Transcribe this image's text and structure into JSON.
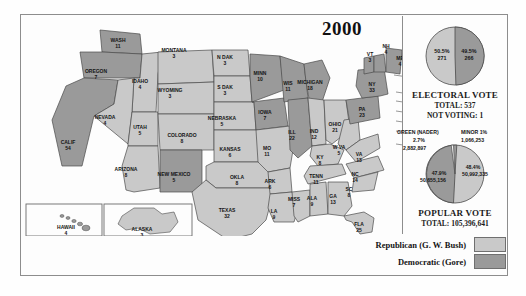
{
  "title": "2000",
  "map": {
    "name": "us-electoral-map-2000",
    "colors": {
      "republican": "#c9c9c9",
      "democratic": "#9a9a9a",
      "stroke": "#4a4a4a",
      "water": "#ffffff"
    },
    "states": [
      {
        "code": "WASH",
        "label": "WASH",
        "votes": "11",
        "party": "dem",
        "x": 96,
        "y": 26
      },
      {
        "code": "OREGON",
        "label": "OREGON",
        "votes": "7",
        "party": "dem",
        "x": 74,
        "y": 57
      },
      {
        "code": "CALIF",
        "label": "CALIF",
        "votes": "54",
        "party": "dem",
        "x": 46,
        "y": 128
      },
      {
        "code": "IDAHO",
        "label": "IDAHO",
        "votes": "4",
        "party": "rep",
        "x": 118,
        "y": 67
      },
      {
        "code": "NEVADA",
        "label": "NEVADA",
        "votes": "4",
        "party": "rep",
        "x": 83,
        "y": 103
      },
      {
        "code": "UTAH",
        "label": "UTAH",
        "votes": "5",
        "party": "rep",
        "x": 118,
        "y": 113
      },
      {
        "code": "ARIZONA",
        "label": "ARIZONA",
        "votes": "8",
        "party": "rep",
        "x": 104,
        "y": 155
      },
      {
        "code": "MONTANA",
        "label": "MONTANA",
        "votes": "3",
        "party": "rep",
        "x": 152,
        "y": 36
      },
      {
        "code": "WYOMING",
        "label": "WYOMING",
        "votes": "3",
        "party": "rep",
        "x": 148,
        "y": 76
      },
      {
        "code": "COLORADO",
        "label": "COLORADO",
        "votes": "8",
        "party": "rep",
        "x": 160,
        "y": 121
      },
      {
        "code": "NEWMEX",
        "label": "NEW MEXICO",
        "votes": "5",
        "party": "dem",
        "x": 152,
        "y": 160
      },
      {
        "code": "NDAK",
        "label": "N DAK",
        "votes": "3",
        "party": "rep",
        "x": 203,
        "y": 43
      },
      {
        "code": "SDAK",
        "label": "S DAK",
        "votes": "3",
        "party": "rep",
        "x": 203,
        "y": 73
      },
      {
        "code": "NEBRASKA",
        "label": "NEBRASKA",
        "votes": "5",
        "party": "rep",
        "x": 200,
        "y": 104
      },
      {
        "code": "KANSAS",
        "label": "KANSAS",
        "votes": "6",
        "party": "rep",
        "x": 208,
        "y": 135
      },
      {
        "code": "OKLA",
        "label": "OKLA",
        "votes": "8",
        "party": "rep",
        "x": 215,
        "y": 163
      },
      {
        "code": "TEXAS",
        "label": "TEXAS",
        "votes": "32",
        "party": "rep",
        "x": 205,
        "y": 196
      },
      {
        "code": "MINN",
        "label": "MINN",
        "votes": "10",
        "party": "dem",
        "x": 238,
        "y": 59
      },
      {
        "code": "IOWA",
        "label": "IOWA",
        "votes": "7",
        "party": "dem",
        "x": 243,
        "y": 98
      },
      {
        "code": "MO",
        "label": "MO",
        "votes": "11",
        "party": "rep",
        "x": 245,
        "y": 134
      },
      {
        "code": "ARK",
        "label": "ARK",
        "votes": "6",
        "party": "rep",
        "x": 248,
        "y": 167
      },
      {
        "code": "LA",
        "label": "LA",
        "votes": "9",
        "party": "rep",
        "x": 252,
        "y": 197
      },
      {
        "code": "WIS",
        "label": "WIS",
        "votes": "11",
        "party": "dem",
        "x": 266,
        "y": 69
      },
      {
        "code": "ILL",
        "label": "ILL",
        "votes": "22",
        "party": "dem",
        "x": 270,
        "y": 118
      },
      {
        "code": "MISS",
        "label": "MISS",
        "votes": "7",
        "party": "rep",
        "x": 272,
        "y": 185
      },
      {
        "code": "MICHIGAN",
        "label": "MICHIGAN",
        "votes": "18",
        "party": "dem",
        "x": 288,
        "y": 68
      },
      {
        "code": "IND",
        "label": "IND",
        "votes": "12",
        "party": "rep",
        "x": 292,
        "y": 117
      },
      {
        "code": "KY",
        "label": "KY",
        "votes": "8",
        "party": "rep",
        "x": 298,
        "y": 143
      },
      {
        "code": "TENN",
        "label": "TENN",
        "votes": "11",
        "party": "rep",
        "x": 294,
        "y": 162
      },
      {
        "code": "ALA",
        "label": "ALA",
        "votes": "9",
        "party": "rep",
        "x": 290,
        "y": 184
      },
      {
        "code": "OHIO",
        "label": "OHIO",
        "votes": "21",
        "party": "rep",
        "x": 313,
        "y": 110
      },
      {
        "code": "WVA",
        "label": "W VA",
        "votes": "5",
        "party": "rep",
        "x": 317,
        "y": 133
      },
      {
        "code": "GA",
        "label": "GA",
        "votes": "13",
        "party": "rep",
        "x": 311,
        "y": 182
      },
      {
        "code": "FLA",
        "label": "FLA",
        "votes": "25",
        "party": "rep",
        "x": 337,
        "y": 210
      },
      {
        "code": "PA",
        "label": "PA",
        "votes": "23",
        "party": "dem",
        "x": 340,
        "y": 95
      },
      {
        "code": "VA",
        "label": "VA",
        "votes": "13",
        "party": "rep",
        "x": 337,
        "y": 140
      },
      {
        "code": "NC",
        "label": "NC",
        "votes": "14",
        "party": "rep",
        "x": 333,
        "y": 160
      },
      {
        "code": "SC",
        "label": "SC",
        "votes": "8",
        "party": "rep",
        "x": 327,
        "y": 175
      },
      {
        "code": "NY",
        "label": "NY",
        "votes": "33",
        "party": "dem",
        "x": 350,
        "y": 70
      },
      {
        "code": "VT",
        "label": "VT",
        "votes": "3",
        "party": "dem",
        "x": 348,
        "y": 40
      },
      {
        "code": "NH",
        "label": "NH",
        "votes": "4",
        "party": "dem",
        "x": 364,
        "y": 32
      },
      {
        "code": "ME",
        "label": "ME",
        "votes": "4",
        "party": "dem",
        "x": 378,
        "y": 44
      },
      {
        "code": "HAWAII",
        "label": "HAWAII",
        "votes": "4",
        "party": "dem",
        "x": 44,
        "y": 213
      },
      {
        "code": "ALASKA",
        "label": "ALASKA",
        "votes": "3",
        "party": "rep",
        "x": 120,
        "y": 215
      }
    ],
    "callouts": [
      {
        "code": "MASS",
        "text": "MASS",
        "votes": "12",
        "party": "dem",
        "x": 388,
        "y": 63
      },
      {
        "code": "RI",
        "text": "R.I. 4",
        "party": "dem",
        "x": 390,
        "y": 80
      },
      {
        "code": "CONN",
        "text": "CONN 8",
        "party": "dem",
        "x": 390,
        "y": 89
      },
      {
        "code": "NJ",
        "text": "NJ 15",
        "party": "dem",
        "x": 390,
        "y": 99
      },
      {
        "code": "DEL",
        "text": "DEL 3",
        "party": "dem",
        "x": 390,
        "y": 109
      },
      {
        "code": "MD",
        "text": "MD 10",
        "party": "dem",
        "x": 390,
        "y": 119
      },
      {
        "code": "DC",
        "text": "DC 3",
        "party": "dem",
        "x": 390,
        "y": 132
      }
    ]
  },
  "electoral": {
    "title": "ELECTORAL VOTE",
    "total_label": "TOTAL:  537",
    "notvoting_label": "NOT VOTING:  1",
    "left": {
      "pct": "50.5%",
      "votes": "271",
      "party": "rep"
    },
    "right": {
      "pct": "49.5%",
      "votes": "266",
      "party": "dem"
    }
  },
  "popular": {
    "title": "POPULAR VOTE",
    "total_label": "TOTAL:  105,396,641",
    "green_name": "GREEN (NADER)",
    "green_pct": "2.7%",
    "green_votes": "2,882,897",
    "minor_name": "MINOR  1%",
    "minor_votes": "1,066,253",
    "dem_pct": "47.9%",
    "dem_votes": "50,655,156",
    "rep_pct": "48.4%",
    "rep_votes": "50,992,335"
  },
  "legend": {
    "republican": "Republican (G. W. Bush)",
    "democratic": "Democratic (Gore)"
  },
  "chart_data": [
    {
      "type": "pie",
      "title": "ELECTORAL VOTE",
      "categories": [
        "Republican (G. W. Bush)",
        "Democratic (Gore)"
      ],
      "values": [
        271,
        266
      ],
      "percents": [
        50.5,
        49.5
      ],
      "total": 537,
      "notes": "NOT VOTING: 1"
    },
    {
      "type": "pie",
      "title": "POPULAR VOTE",
      "categories": [
        "Republican (G. W. Bush)",
        "Democratic (Gore)",
        "Green (Nader)",
        "Minor"
      ],
      "values": [
        50992335,
        50655156,
        2882897,
        1066253
      ],
      "percents": [
        48.4,
        47.9,
        2.7,
        1.0
      ],
      "total": 105396641
    },
    {
      "type": "map",
      "title": "2000 U.S. Presidential Election - Electoral Votes by State",
      "categories": [
        "WASH",
        "OREGON",
        "CALIF",
        "IDAHO",
        "NEVADA",
        "UTAH",
        "ARIZONA",
        "MONTANA",
        "WYOMING",
        "COLORADO",
        "NEW MEXICO",
        "N DAK",
        "S DAK",
        "NEBRASKA",
        "KANSAS",
        "OKLA",
        "TEXAS",
        "MINN",
        "IOWA",
        "MO",
        "ARK",
        "LA",
        "WIS",
        "ILL",
        "MISS",
        "MICHIGAN",
        "IND",
        "KY",
        "TENN",
        "ALA",
        "OHIO",
        "W VA",
        "GA",
        "FLA",
        "PA",
        "VA",
        "NC",
        "SC",
        "NY",
        "VT",
        "NH",
        "ME",
        "MASS",
        "RI",
        "CONN",
        "NJ",
        "DEL",
        "MD",
        "DC",
        "HAWAII",
        "ALASKA"
      ],
      "values": [
        11,
        7,
        54,
        4,
        4,
        5,
        8,
        3,
        3,
        8,
        5,
        3,
        3,
        5,
        6,
        8,
        32,
        10,
        7,
        11,
        6,
        9,
        11,
        22,
        7,
        18,
        12,
        8,
        11,
        9,
        21,
        5,
        13,
        25,
        23,
        13,
        14,
        8,
        33,
        3,
        4,
        4,
        12,
        4,
        8,
        15,
        3,
        10,
        3,
        4,
        3
      ],
      "series": [
        {
          "name": "party",
          "values": [
            "dem",
            "dem",
            "dem",
            "rep",
            "rep",
            "rep",
            "rep",
            "rep",
            "rep",
            "rep",
            "dem",
            "rep",
            "rep",
            "rep",
            "rep",
            "rep",
            "rep",
            "dem",
            "dem",
            "rep",
            "rep",
            "rep",
            "dem",
            "dem",
            "rep",
            "dem",
            "rep",
            "rep",
            "rep",
            "rep",
            "rep",
            "rep",
            "rep",
            "rep",
            "dem",
            "rep",
            "rep",
            "rep",
            "dem",
            "dem",
            "dem",
            "dem",
            "dem",
            "dem",
            "dem",
            "dem",
            "dem",
            "dem",
            "dem",
            "dem",
            "rep"
          ]
        }
      ]
    }
  ]
}
